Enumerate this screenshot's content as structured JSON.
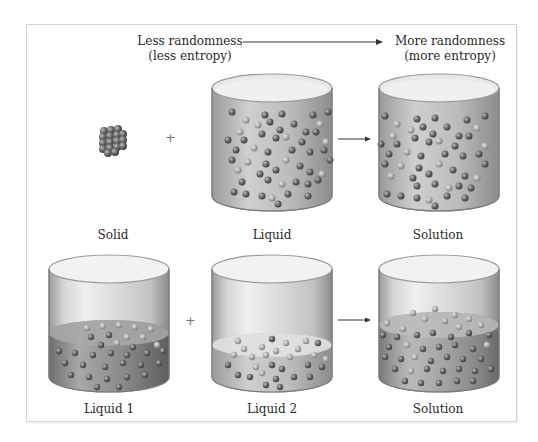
{
  "header": {
    "left_line1": "Less randomness",
    "left_line2": "(less entropy)",
    "right_line1": "More randomness",
    "right_line2": "(more entropy)",
    "arrow_icon": "right-arrow-icon"
  },
  "rows": [
    {
      "items": [
        {
          "label": "Solid",
          "type": "solid-crystal"
        },
        {
          "operator": "+"
        },
        {
          "label": "Liquid",
          "type": "beaker-full-liquid"
        },
        {
          "operator": "→"
        },
        {
          "label": "Solution",
          "type": "beaker-full-solution"
        }
      ]
    },
    {
      "items": [
        {
          "label": "Liquid 1",
          "type": "beaker-liquid-half"
        },
        {
          "operator": "+"
        },
        {
          "label": "Liquid 2",
          "type": "beaker-liquid-low"
        },
        {
          "operator": "→"
        },
        {
          "label": "Solution",
          "type": "beaker-mixed-solution"
        }
      ]
    }
  ],
  "colors": {
    "frame_border": "#d6d6d6",
    "glass": "#c8c8c8",
    "liquid_dark": "#8e8e8e",
    "particle": "#5a5a5a",
    "arrow": "#333333"
  }
}
